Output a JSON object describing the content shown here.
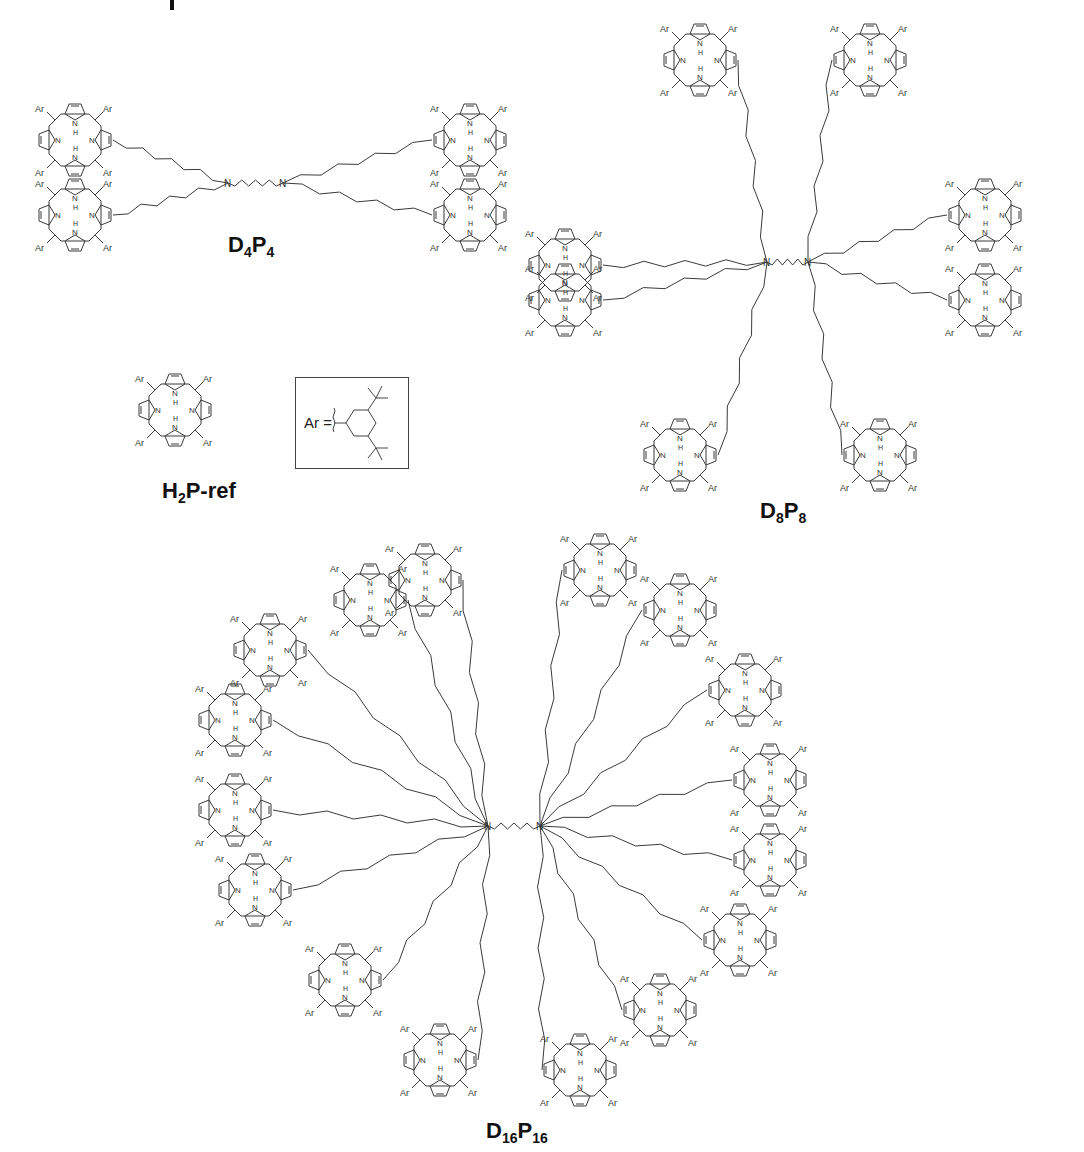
{
  "figure": {
    "panel_marker": "I",
    "compounds": [
      {
        "id": "D4P4",
        "label_main": "D",
        "sub1": "4",
        "label_mid": "P",
        "sub2": "4",
        "label_x": 228,
        "label_y": 232
      },
      {
        "id": "D8P8",
        "label_main": "D",
        "sub1": "8",
        "label_mid": "P",
        "sub2": "8",
        "label_x": 760,
        "label_y": 498
      },
      {
        "id": "H2P-ref",
        "label_main": "H",
        "sub1": "2",
        "label_mid": "P-ref",
        "sub2": "",
        "label_x": 162,
        "label_y": 478
      },
      {
        "id": "D16P16",
        "label_main": "D",
        "sub1": "16",
        "label_mid": "P",
        "sub2": "16",
        "label_x": 486,
        "label_y": 1118
      }
    ],
    "ar_definition": {
      "text": "Ar =",
      "substituent": "3,5-di-tert-butylphenyl",
      "box": {
        "x": 295,
        "y": 377,
        "w": 112,
        "h": 90
      }
    },
    "atom_labels": {
      "ar": "Ar",
      "n": "N",
      "h": "H",
      "nh": "NH",
      "hn": "HN",
      "o": "O"
    },
    "porphyrins": {
      "D4P4": [
        [
          75,
          140
        ],
        [
          470,
          140
        ],
        [
          75,
          215
        ],
        [
          470,
          215
        ]
      ],
      "H2P-ref": [
        [
          175,
          410
        ]
      ],
      "D8P8": [
        [
          700,
          60
        ],
        [
          870,
          60
        ],
        [
          565,
          265
        ],
        [
          985,
          215
        ],
        [
          565,
          300
        ],
        [
          985,
          300
        ],
        [
          680,
          455
        ],
        [
          880,
          455
        ]
      ],
      "D16P16": [
        [
          425,
          580
        ],
        [
          370,
          600
        ],
        [
          270,
          650
        ],
        [
          235,
          720
        ],
        [
          235,
          810
        ],
        [
          255,
          890
        ],
        [
          345,
          980
        ],
        [
          440,
          1060
        ],
        [
          600,
          570
        ],
        [
          680,
          610
        ],
        [
          745,
          690
        ],
        [
          770,
          780
        ],
        [
          770,
          860
        ],
        [
          740,
          940
        ],
        [
          660,
          1010
        ],
        [
          580,
          1070
        ]
      ]
    },
    "cores": {
      "D4P4": [
        [
          228,
          183
        ],
        [
          283,
          183
        ]
      ],
      "D8P8": [
        [
          767,
          262
        ],
        [
          808,
          262
        ]
      ],
      "D16P16": [
        [
          488,
          826
        ],
        [
          540,
          826
        ]
      ]
    },
    "colors": {
      "line": "#3a3a3a",
      "text": "#111111",
      "background": "#ffffff"
    }
  }
}
